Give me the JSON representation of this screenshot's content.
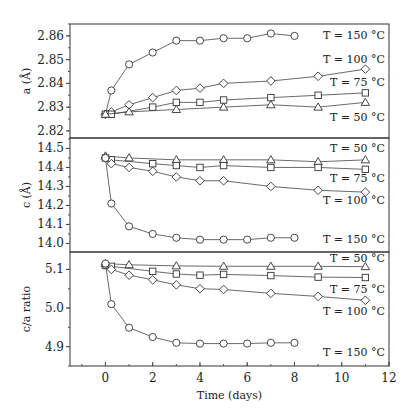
{
  "chart_data": [
    {
      "type": "line",
      "panel": "top",
      "ylabel": "a (Å)",
      "ylim": [
        2.817,
        2.865
      ],
      "yticks": [
        2.82,
        2.83,
        2.84,
        2.85,
        2.86
      ],
      "ytick_labels": [
        "2.82",
        "2.83",
        "2.84",
        "2.85",
        "2.86"
      ],
      "series": [
        {
          "name": "T = 150 °C",
          "marker": "circle",
          "x": [
            0,
            0.25,
            1,
            2,
            3,
            4,
            5,
            6,
            7,
            8
          ],
          "y": [
            2.827,
            2.837,
            2.848,
            2.853,
            2.858,
            2.858,
            2.859,
            2.859,
            2.861,
            2.86
          ]
        },
        {
          "name": "T = 100 °C",
          "marker": "diamond",
          "x": [
            0,
            0.25,
            1,
            2,
            3,
            4,
            5,
            7,
            9,
            11
          ],
          "y": [
            2.827,
            2.828,
            2.831,
            2.834,
            2.837,
            2.838,
            2.84,
            2.841,
            2.843,
            2.846
          ]
        },
        {
          "name": "T = 75 °C",
          "marker": "square",
          "x": [
            0,
            0.25,
            2,
            3,
            4,
            5,
            7,
            9,
            11
          ],
          "y": [
            2.827,
            2.827,
            2.83,
            2.832,
            2.832,
            2.833,
            2.834,
            2.835,
            2.836
          ]
        },
        {
          "name": "T = 50 °C",
          "marker": "triangle",
          "x": [
            0,
            1,
            3,
            5,
            7,
            9,
            11
          ],
          "y": [
            2.827,
            2.828,
            2.829,
            2.83,
            2.831,
            2.83,
            2.832
          ]
        }
      ],
      "annotations": [
        {
          "text": "T = 150 °C",
          "y_px": 35
        },
        {
          "text": "T = 100 °C",
          "y_px": 59
        },
        {
          "text": "T = 75 °C",
          "y_px": 82
        },
        {
          "text": "T = 50 °C",
          "y_px": 117
        }
      ]
    },
    {
      "type": "line",
      "panel": "middle",
      "ylabel": "c (Å)",
      "ylim": [
        13.955,
        14.555
      ],
      "yticks": [
        14.0,
        14.1,
        14.2,
        14.3,
        14.4,
        14.5
      ],
      "ytick_labels": [
        "14.0",
        "14.1",
        "14.2",
        "14.3",
        "14.4",
        "14.5"
      ],
      "series": [
        {
          "name": "T = 50 °C",
          "marker": "triangle",
          "x": [
            0,
            1,
            3,
            5,
            7,
            9,
            11
          ],
          "y": [
            14.46,
            14.45,
            14.44,
            14.44,
            14.44,
            14.43,
            14.44
          ]
        },
        {
          "name": "T = 75 °C",
          "marker": "square",
          "x": [
            0,
            0.25,
            2,
            3,
            4,
            5,
            7,
            9,
            11
          ],
          "y": [
            14.45,
            14.44,
            14.42,
            14.41,
            14.4,
            14.41,
            14.4,
            14.4,
            14.39
          ]
        },
        {
          "name": "T = 100 °C",
          "marker": "diamond",
          "x": [
            0,
            0.25,
            1,
            2,
            3,
            4,
            5,
            7,
            9,
            11
          ],
          "y": [
            14.45,
            14.42,
            14.4,
            14.38,
            14.35,
            14.33,
            14.33,
            14.3,
            14.28,
            14.27
          ]
        },
        {
          "name": "T = 150 °C",
          "marker": "circle",
          "x": [
            0,
            0.25,
            1,
            2,
            3,
            4,
            5,
            6,
            7,
            8
          ],
          "y": [
            14.45,
            14.21,
            14.09,
            14.05,
            14.03,
            14.02,
            14.02,
            14.02,
            14.03,
            14.03
          ]
        }
      ],
      "annotations": [
        {
          "text": "T = 50 °C",
          "y_px": 148
        },
        {
          "text": "T = 75 °C",
          "y_px": 178
        },
        {
          "text": "T = 100 °C",
          "y_px": 200
        },
        {
          "text": "T = 150 °C",
          "y_px": 239
        }
      ]
    },
    {
      "type": "line",
      "panel": "bottom",
      "ylabel": "c/a ratio",
      "ylim": [
        4.85,
        5.145
      ],
      "yticks": [
        4.9,
        5.0,
        5.1
      ],
      "ytick_labels": [
        "4.9",
        "5.0",
        "5.1"
      ],
      "xlabel": "Time (days)",
      "xlim": [
        -1.5,
        12
      ],
      "xticks": [
        0,
        2,
        4,
        6,
        8,
        10,
        12
      ],
      "xtick_labels": [
        "0",
        "2",
        "4",
        "6",
        "8",
        "10",
        "12"
      ],
      "series": [
        {
          "name": "T = 50 °C",
          "marker": "triangle",
          "x": [
            0,
            1,
            3,
            5,
            7,
            9,
            11
          ],
          "y": [
            5.115,
            5.112,
            5.109,
            5.108,
            5.108,
            5.108,
            5.107
          ]
        },
        {
          "name": "T = 75 °C",
          "marker": "square",
          "x": [
            0,
            0.25,
            2,
            3,
            4,
            5,
            7,
            9,
            11
          ],
          "y": [
            5.11,
            5.108,
            5.095,
            5.088,
            5.085,
            5.087,
            5.084,
            5.08,
            5.079
          ]
        },
        {
          "name": "T = 100 °C",
          "marker": "diamond",
          "x": [
            0,
            0.25,
            1,
            2,
            3,
            4,
            5,
            7,
            9,
            11
          ],
          "y": [
            5.112,
            5.1,
            5.085,
            5.073,
            5.06,
            5.05,
            5.048,
            5.038,
            5.03,
            5.02
          ]
        },
        {
          "name": "T = 150 °C",
          "marker": "circle",
          "x": [
            0,
            0.25,
            1,
            2,
            3,
            4,
            5,
            6,
            7,
            8
          ],
          "y": [
            5.115,
            5.01,
            4.949,
            4.925,
            4.91,
            4.908,
            4.908,
            4.908,
            4.91,
            4.91
          ]
        }
      ],
      "annotations": [
        {
          "text": "T = 50 °C",
          "y_px": 258
        },
        {
          "text": "T = 75 °C",
          "y_px": 289
        },
        {
          "text": "T = 100 °C",
          "y_px": 311
        },
        {
          "text": "T = 150 °C",
          "y_px": 352
        }
      ]
    }
  ]
}
